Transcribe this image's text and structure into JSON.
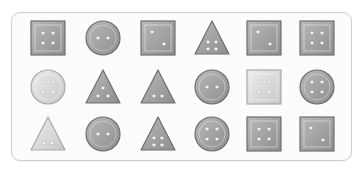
{
  "panel": {
    "rows": 3,
    "columns": 6,
    "items": [
      {
        "shape": "square",
        "holes": 4,
        "tone": "mid",
        "cx": 48,
        "cy": 38
      },
      {
        "shape": "circle",
        "holes": 2,
        "tone": "mid",
        "cx": 103,
        "cy": 38
      },
      {
        "shape": "square",
        "holes": 2,
        "tone": "mid",
        "cx": 158,
        "cy": 38
      },
      {
        "shape": "triangle",
        "holes": 4,
        "tone": "mid",
        "cx": 212,
        "cy": 38
      },
      {
        "shape": "square",
        "holes": 2,
        "tone": "mid",
        "cx": 264,
        "cy": 38
      },
      {
        "shape": "square",
        "holes": 4,
        "tone": "mid",
        "cx": 317,
        "cy": 38
      },
      {
        "shape": "circle",
        "holes": 4,
        "tone": "light",
        "cx": 48,
        "cy": 87
      },
      {
        "shape": "triangle",
        "holes": 3,
        "tone": "mid",
        "cx": 103,
        "cy": 87
      },
      {
        "shape": "triangle",
        "holes": 2,
        "tone": "mid",
        "cx": 158,
        "cy": 87
      },
      {
        "shape": "circle",
        "holes": 2,
        "tone": "mid",
        "cx": 212,
        "cy": 87
      },
      {
        "shape": "square",
        "holes": 4,
        "tone": "light",
        "cx": 264,
        "cy": 87
      },
      {
        "shape": "circle",
        "holes": 4,
        "tone": "mid",
        "cx": 317,
        "cy": 87
      },
      {
        "shape": "triangle",
        "holes": 2,
        "tone": "light",
        "cx": 48,
        "cy": 134
      },
      {
        "shape": "circle",
        "holes": 2,
        "tone": "mid",
        "cx": 103,
        "cy": 134
      },
      {
        "shape": "triangle",
        "holes": 4,
        "tone": "mid",
        "cx": 158,
        "cy": 134
      },
      {
        "shape": "circle",
        "holes": 4,
        "tone": "mid",
        "cx": 212,
        "cy": 134
      },
      {
        "shape": "square",
        "holes": 4,
        "tone": "mid",
        "cx": 264,
        "cy": 134
      },
      {
        "shape": "square",
        "holes": 2,
        "tone": "mid",
        "cx": 317,
        "cy": 134
      }
    ]
  },
  "colors": {
    "mid_fill_top": "#b9b9b9",
    "mid_fill_bottom": "#8e8e8e",
    "mid_stroke": "#6e6e6e",
    "light_fill_top": "#ececec",
    "light_fill_bottom": "#c8c8c8",
    "light_stroke": "#a9a9a9",
    "hole": "#f4f4f4"
  }
}
